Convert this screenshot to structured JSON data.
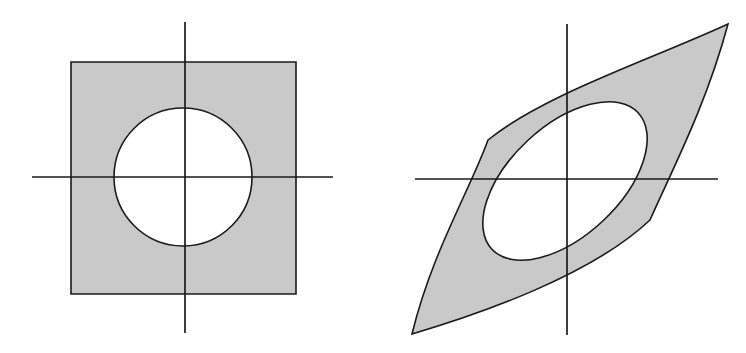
{
  "figure": {
    "background_color": "#ffffff",
    "shading_color": "#c9c9c9",
    "line_color": "#1a1a1a",
    "canvas": {
      "width": 746,
      "height": 353
    }
  },
  "panels": [
    {
      "id": "left-panel",
      "name": "square-with-circular-hole",
      "caption": "",
      "axes": {
        "origin": {
          "x": 185,
          "y": 177
        },
        "x_axis": {
          "x1": 32,
          "y1": 177,
          "x2": 333,
          "y2": 177
        },
        "y_axis": {
          "x1": 185,
          "y1": 22,
          "x2": 185,
          "y2": 333
        },
        "stroke_width": 1.7
      },
      "outer_boundary": {
        "shape": "square",
        "left": 71,
        "top": 62,
        "right": 296,
        "bottom": 294,
        "width": 225,
        "height": 232
      },
      "hole": {
        "shape": "circle",
        "center_x": 183,
        "center_y": 177,
        "radius": 69
      }
    },
    {
      "id": "right-panel",
      "name": "cusped-lens-with-elliptical-hole",
      "caption": "",
      "axes": {
        "origin": {
          "x": 567,
          "y": 179
        },
        "x_axis": {
          "x1": 415,
          "y1": 179,
          "x2": 718,
          "y2": 179
        },
        "y_axis": {
          "x1": 567,
          "y1": 24,
          "x2": 567,
          "y2": 335
        },
        "stroke_width": 1.7
      },
      "outer_boundary": {
        "shape": "two-cusped-lens",
        "cusp_lower_left": {
          "x": 412,
          "y": 334
        },
        "cusp_upper_right": {
          "x": 728,
          "y": 24
        },
        "upper_arc_extreme": {
          "x": 488,
          "y": 140
        },
        "lower_arc_extreme": {
          "x": 650,
          "y": 220
        }
      },
      "hole": {
        "shape": "rotated-ellipse",
        "center_x": 565,
        "center_y": 181,
        "semi_major": 100,
        "semi_minor": 55,
        "rotation_degrees": -43
      }
    }
  ]
}
